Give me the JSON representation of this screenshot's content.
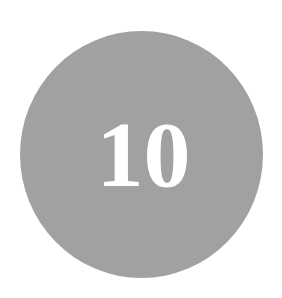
{
  "badge": {
    "number": "10",
    "fill_color": "#a1a1a1",
    "text_color": "#ffffff"
  }
}
